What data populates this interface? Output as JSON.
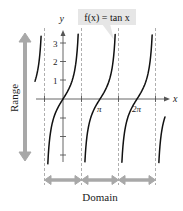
{
  "figure": {
    "function_label": "f(x) = tan x",
    "axis_x_label": "x",
    "axis_y_label": "y",
    "range_label": "Range",
    "domain_label": "Domain",
    "y_ticks": [
      "3",
      "2",
      "1"
    ],
    "x_ticks": [
      "π",
      "2π"
    ],
    "colors": {
      "curve": "#111111",
      "axis": "#555555",
      "asymptote": "#9a9a9a",
      "arrow": "#a8a8a8",
      "callout": "#e6e6e6"
    }
  },
  "chart_data": {
    "type": "line",
    "title": "f(x) = tan x",
    "xlabel": "x",
    "ylabel": "y",
    "x_tick_labels": [
      "π",
      "2π"
    ],
    "y_tick_labels": [
      "1",
      "2",
      "3"
    ],
    "ylim": [
      -3.5,
      3.5
    ],
    "xlim": [
      -2.4,
      8.7
    ],
    "asymptotes": [
      "-π/2",
      "π/2",
      "3π/2",
      "5π/2"
    ],
    "series": [
      {
        "name": "tan x",
        "expression": "tan(x)",
        "branches": [
          {
            "x_from": -2.38,
            "x_to": -1.86
          },
          {
            "x_from": -1.29,
            "x_to": 1.29
          },
          {
            "x_from": 1.86,
            "x_to": 4.43
          },
          {
            "x_from": 5.0,
            "x_to": 7.57
          },
          {
            "x_from": 8.14,
            "x_to": 8.66
          }
        ]
      }
    ],
    "annotations": [
      "Range (vertical double arrow: all real numbers)",
      "Domain (double arrows between asymptotes)"
    ],
    "grid": false
  }
}
